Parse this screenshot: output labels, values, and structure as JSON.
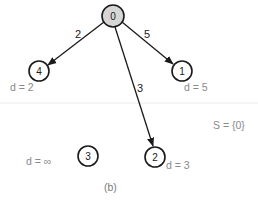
{
  "diagram": {
    "caption": "(b)",
    "set_label": "S = {0}",
    "nodes": [
      {
        "id": "0",
        "label": "0",
        "x": 113,
        "y": 16,
        "source": true
      },
      {
        "id": "1",
        "label": "1",
        "x": 182,
        "y": 71,
        "distance": "d = 5"
      },
      {
        "id": "2",
        "label": "2",
        "x": 155,
        "y": 157,
        "distance": "d = 3"
      },
      {
        "id": "3",
        "label": "3",
        "x": 88,
        "y": 156,
        "distance": "d = ∞"
      },
      {
        "id": "4",
        "label": "4",
        "x": 39,
        "y": 71,
        "distance": "d = 2"
      }
    ],
    "edges": [
      {
        "from": "0",
        "to": "4",
        "weight": "2"
      },
      {
        "from": "0",
        "to": "1",
        "weight": "5"
      },
      {
        "from": "0",
        "to": "2",
        "weight": "3"
      }
    ],
    "colors": {
      "stroke": "#1a1a1a",
      "source_fill": "#d6d6d6",
      "annotation": "#8a8a8a"
    }
  }
}
